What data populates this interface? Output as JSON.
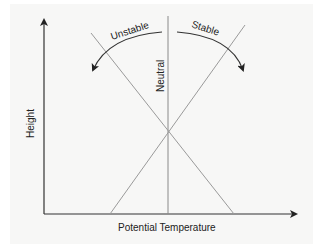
{
  "diagram": {
    "title": "",
    "axes": {
      "x_label": "Potential Temperature",
      "y_label": "Height"
    },
    "lines": [
      {
        "name": "Neutral",
        "label": "Neutral"
      },
      {
        "name": "Unstable",
        "label": "Unstable"
      },
      {
        "name": "Stable",
        "label": "Stable"
      }
    ],
    "colors": {
      "axis": "#222222",
      "lines": "#8a8a8a",
      "arrows": "#333333",
      "background": "#f7f7f6"
    }
  }
}
